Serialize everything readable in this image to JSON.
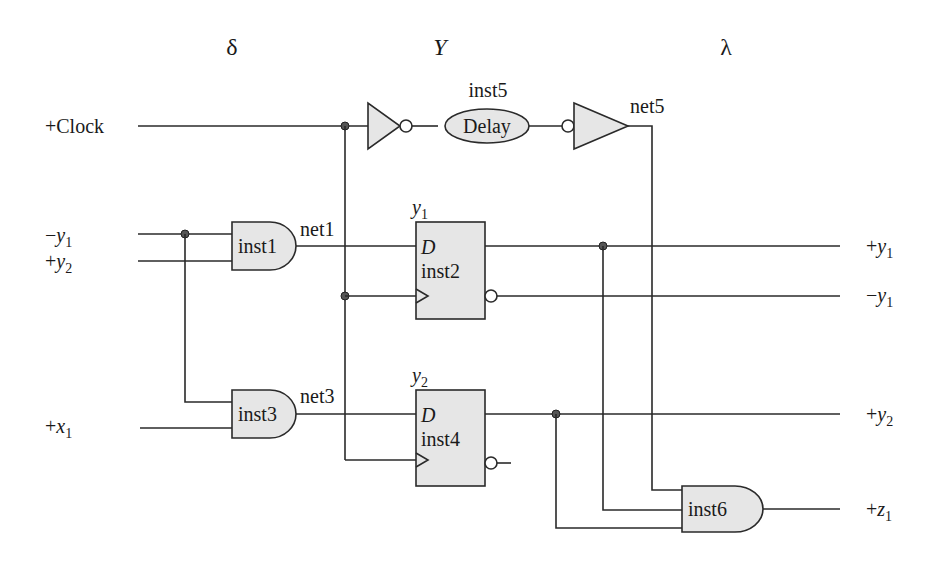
{
  "headers": {
    "delta": "δ",
    "Y": "Y",
    "lambda": "λ"
  },
  "inputs": {
    "clock": "+Clock",
    "neg_y1": {
      "sign": "−",
      "var": "y",
      "sub": "1"
    },
    "pos_y2": {
      "sign": "+",
      "var": "y",
      "sub": "2"
    },
    "pos_x1": {
      "sign": "+",
      "var": "x",
      "sub": "1"
    }
  },
  "outputs": {
    "pos_y1": {
      "sign": "+",
      "var": "y",
      "sub": "1"
    },
    "neg_y1": {
      "sign": "−",
      "var": "y",
      "sub": "1"
    },
    "pos_y2": {
      "sign": "+",
      "var": "y",
      "sub": "2"
    },
    "pos_z1": {
      "sign": "+",
      "var": "z",
      "sub": "1"
    }
  },
  "components": {
    "inst1": "inst1",
    "inst2": "inst2",
    "inst3": "inst3",
    "inst4": "inst4",
    "inst5": "inst5",
    "inst6": "inst6",
    "delay": "Delay",
    "d_input": "D"
  },
  "nets": {
    "net1": "net1",
    "net3": "net3",
    "net5": "net5"
  },
  "flipflop_labels": {
    "ff1": {
      "var": "y",
      "sub": "1"
    },
    "ff2": {
      "var": "y",
      "sub": "2"
    }
  }
}
